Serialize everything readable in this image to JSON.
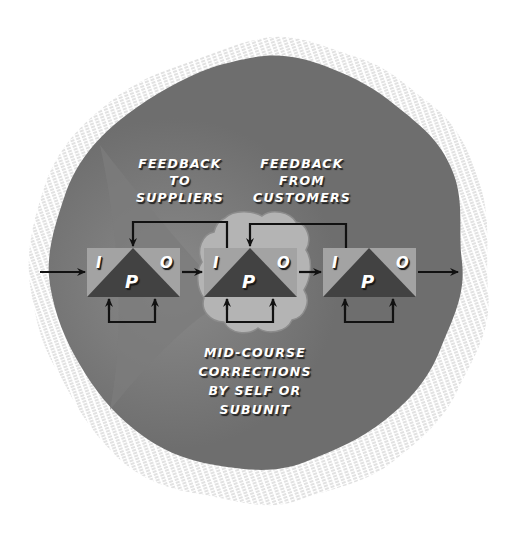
{
  "diagram": {
    "labels": {
      "feedback_to_suppliers": [
        "FEEDBACK",
        "TO",
        "SUPPLIERS"
      ],
      "feedback_from_customers": [
        "FEEDBACK",
        "FROM",
        "CUSTOMERS"
      ],
      "mid_course": [
        "MID-COURSE",
        "CORRECTIONS",
        "BY SELF OR",
        "SUBUNIT"
      ]
    },
    "ipo_units": [
      {
        "input": "I",
        "process": "P",
        "output": "O"
      },
      {
        "input": "I",
        "process": "P",
        "output": "O",
        "highlighted": true
      },
      {
        "input": "I",
        "process": "P",
        "output": "O"
      }
    ],
    "colors": {
      "background_blob": "#6e6e6e",
      "box_light": "#a3a3a3",
      "triangle_dark": "#424242",
      "highlight_cloud": "#b4b4b4",
      "arrow": "#111111",
      "hatch": "#bdbdbd"
    }
  }
}
